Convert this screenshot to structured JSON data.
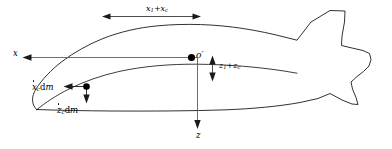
{
  "labels": {
    "x_axis": "x",
    "z_axis": "z",
    "origin": "o′",
    "x_dimension": {
      "term1_base": "x",
      "term1_sub": "1",
      "operator": "+",
      "term2_base": "x",
      "term2_sub": "c"
    },
    "z_dimension": {
      "term1_base": "z",
      "term1_sub": "1",
      "operator": "+",
      "term2_base": "z",
      "term2_sub": "c"
    },
    "x_velocity_element": {
      "variable": "x",
      "subscript": "c",
      "differential": "d",
      "mass": "m"
    },
    "z_velocity_element": {
      "variable": "z",
      "subscript": "c",
      "differential": "d",
      "mass": "m"
    }
  },
  "colors": {
    "outline": "#1a1a1a",
    "axis": "#4a4a4a",
    "marker": "#000000",
    "background": "#ffffff"
  },
  "markers": {
    "origin_point": "origin-dot",
    "mass_element_point": "mass-element-dot"
  }
}
